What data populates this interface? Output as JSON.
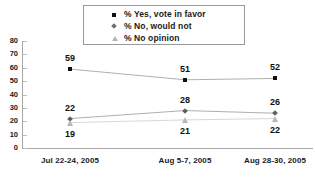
{
  "chart_data": {
    "type": "line",
    "title": "",
    "subtitle": "",
    "xlabel": "",
    "ylabel": "",
    "ylim": [
      0,
      80
    ],
    "yticks": [
      "0",
      "10",
      "20",
      "30",
      "40",
      "50",
      "60",
      "70",
      "80"
    ],
    "grid": false,
    "legend_position": "top-center",
    "categories": [
      "Jul 22-24, 2005",
      "Aug 5-7, 2005",
      "Aug 28-30, 2005"
    ],
    "series": [
      {
        "name": "% Yes, vote in favor",
        "marker": "square",
        "color": "#111111",
        "values": [
          59,
          51,
          52
        ],
        "labels": [
          "59",
          "51",
          "52"
        ]
      },
      {
        "name": "% No, would not",
        "marker": "diamond",
        "color": "#5f5f5f",
        "values": [
          22,
          28,
          26
        ],
        "labels": [
          "22",
          "28",
          "26"
        ]
      },
      {
        "name": "% No opinion",
        "marker": "triangle",
        "color": "#b8b8b8",
        "values": [
          19,
          21,
          22
        ],
        "labels": [
          "19",
          "21",
          "22"
        ]
      }
    ]
  },
  "legend": {
    "items": [
      {
        "label": "% Yes, vote in favor",
        "marker": "square"
      },
      {
        "label": "% No, would not",
        "marker": "diamond"
      },
      {
        "label": "% No opinion",
        "marker": "triangle"
      }
    ]
  },
  "axes": {
    "y_tick_labels": [
      "80",
      "70",
      "60",
      "50",
      "40",
      "30",
      "20",
      "10",
      "0"
    ],
    "x_tick_labels": [
      "Jul 22-24, 2005",
      "Aug 5-7, 2005",
      "Aug 28-30, 2005"
    ]
  },
  "colors": {
    "series_yes": "#111111",
    "series_no": "#5f5f5f",
    "series_noopinion": "#b8b8b8",
    "axis": "#a8a8a8",
    "text": "#1a1a1a",
    "background": "#ffffff"
  }
}
